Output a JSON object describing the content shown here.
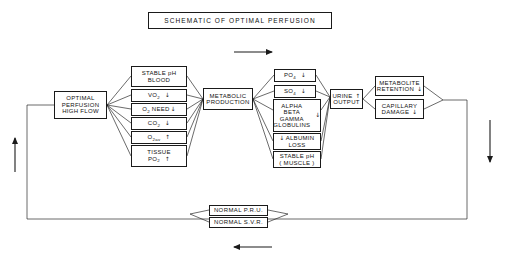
{
  "title": {
    "text": "SCHEMATIC OF OPTIMAL PERFUSION"
  },
  "nodes": {
    "optimal_perfusion": {
      "line1": "OPTIMAL",
      "line2": "PERFUSION",
      "line3": "HIGH FLOW"
    },
    "stable_ph_blood": {
      "line1": "STABLE pH",
      "line2": "BLOOD"
    },
    "vo2": {
      "label": "VO",
      "sub": "2",
      "arrow": "↓"
    },
    "o2_need": {
      "label": "O",
      "sub": "2",
      "label2": " NEED",
      "arrow": "↓"
    },
    "co2": {
      "label": "CO",
      "sub": "2",
      "arrow": "↓"
    },
    "o2av": {
      "label": "O",
      "sub": "2av",
      "arrow": "↑"
    },
    "tissue_po2": {
      "line1": "TISSUE",
      "label": "PO",
      "sub": "2",
      "arrow": "↑"
    },
    "metabolic_production": {
      "line1": "METABOLIC",
      "line2": "PRODUCTION"
    },
    "po4": {
      "label": "PO",
      "sub": "4",
      "arrow": "↓"
    },
    "so4": {
      "label": "SO",
      "sub": "4",
      "arrow": "↓"
    },
    "globulins": {
      "line1": "ALPHA",
      "line2": "BETA",
      "line3": "GAMMA",
      "line4": "GLOBULINS",
      "arrow": "↓"
    },
    "albumin_loss": {
      "arrow": "↓",
      "line1": "ALBUMIN",
      "line2": "LOSS"
    },
    "stable_ph_muscle": {
      "line1": "STABLE pH",
      "line2": "( MUSCLE )"
    },
    "urine_output": {
      "line1": "URINE",
      "line2": "OUTPUT",
      "arrow": "↑"
    },
    "metabolite_retention": {
      "line1": "METABOLITE",
      "line2": "RETENTION",
      "arrow": "↓"
    },
    "capillary_damage": {
      "line1": "CAPILLARY",
      "line2": "DAMAGE",
      "arrow": "↓"
    },
    "normal_pru": {
      "text": "NORMAL  P.R.U."
    },
    "normal_svr": {
      "text": "NORMAL  S.V.R."
    }
  },
  "flow_arrows": {
    "top_direction": "right",
    "bottom_direction": "left",
    "left_direction": "up",
    "right_direction": "down"
  },
  "colors": {
    "stroke": "#1a1a1a",
    "background": "#ffffff",
    "text": "#111111"
  }
}
